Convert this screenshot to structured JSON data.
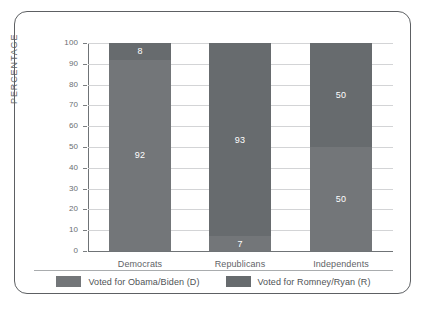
{
  "chart_data": {
    "type": "bar",
    "subtype": "stacked-100",
    "title": "",
    "xlabel": "",
    "ylabel": "PERCENTAGE",
    "ylim": [
      0,
      100
    ],
    "ytick_step": 10,
    "yticks": [
      100,
      90,
      80,
      70,
      60,
      50,
      40,
      30,
      20,
      10,
      0
    ],
    "grid": true,
    "legend_position": "bottom",
    "categories": [
      "Democrats",
      "Republicans",
      "Independents"
    ],
    "series": [
      {
        "name": "Voted for Obama/Biden (D)",
        "color": "#737679",
        "stack_position": "bottom",
        "values": [
          92,
          7,
          50
        ]
      },
      {
        "name": "Voted for Romney/Ryan (R)",
        "color": "#676b6e",
        "stack_position": "top",
        "values": [
          8,
          93,
          50
        ]
      }
    ],
    "data_labels": [
      {
        "category": "Democrats",
        "bottom": "92",
        "top": "8"
      },
      {
        "category": "Republicans",
        "bottom": "7",
        "top": "93"
      },
      {
        "category": "Independents",
        "bottom": "50",
        "top": "50"
      }
    ]
  },
  "axis": {
    "y_title": "PERCENTAGE",
    "y_tick_labels": [
      "100",
      "90",
      "80",
      "70",
      "60",
      "50",
      "40",
      "30",
      "20",
      "10",
      "0"
    ],
    "x_tick_labels": [
      "Democrats",
      "Republicans",
      "Independents"
    ]
  },
  "legend": {
    "items": [
      {
        "label": "Voted for Obama/Biden (D)",
        "color": "#737679"
      },
      {
        "label": "Voted for Romney/Ryan (R)",
        "color": "#676b6e"
      }
    ]
  },
  "style": {
    "frame_color": "#5d6063",
    "grid_color": "#d3d4d6",
    "axis_color": "#6f7376",
    "label_color": "#5f6367",
    "value_label_color": "#ffffff"
  }
}
